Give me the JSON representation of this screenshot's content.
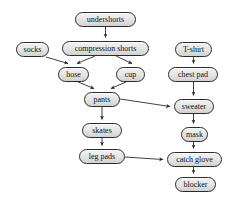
{
  "diagram": {
    "background_color": "#ffffff",
    "node_fill_color": "#e3e3e3",
    "node_border_color": "#2b2b2b",
    "edge_color": "#2b2b2b",
    "text_color": "#111111",
    "nodes": [
      {
        "id": "undershorts",
        "label": "undershorts",
        "x": 75,
        "y": 12,
        "w": 61,
        "h": 15
      },
      {
        "id": "socks",
        "label": "socks",
        "x": 16,
        "y": 42,
        "w": 33,
        "h": 15
      },
      {
        "id": "compression-shorts",
        "label": "compression shorts",
        "x": 62,
        "y": 41,
        "w": 87,
        "h": 15
      },
      {
        "id": "t-shirt",
        "label": "T-shirt",
        "x": 175,
        "y": 42,
        "w": 37,
        "h": 15
      },
      {
        "id": "hose",
        "label": "hose",
        "x": 58,
        "y": 67,
        "w": 31,
        "h": 15
      },
      {
        "id": "cup",
        "label": "cup",
        "x": 116,
        "y": 67,
        "w": 29,
        "h": 15
      },
      {
        "id": "chest-pad",
        "label": "chest pad",
        "x": 168,
        "y": 67,
        "w": 50,
        "h": 15
      },
      {
        "id": "pants",
        "label": "pants",
        "x": 84,
        "y": 92,
        "w": 36,
        "h": 15
      },
      {
        "id": "sweater",
        "label": "sweater",
        "x": 174,
        "y": 99,
        "w": 40,
        "h": 15
      },
      {
        "id": "skates",
        "label": "skates",
        "x": 82,
        "y": 123,
        "w": 40,
        "h": 15
      },
      {
        "id": "mask",
        "label": "mask",
        "x": 181,
        "y": 127,
        "w": 27,
        "h": 15
      },
      {
        "id": "leg-pads",
        "label": "leg pads",
        "x": 79,
        "y": 149,
        "w": 46,
        "h": 15
      },
      {
        "id": "catch-glove",
        "label": "catch glove",
        "x": 167,
        "y": 152,
        "w": 55,
        "h": 15
      },
      {
        "id": "blocker",
        "label": "blocker",
        "x": 175,
        "y": 177,
        "w": 41,
        "h": 15
      }
    ],
    "edges": [
      {
        "from": "undershorts",
        "to": "compression-shorts",
        "path": "M 105.5 27 L 105.5 37.5"
      },
      {
        "from": "socks",
        "to": "hose",
        "path": "M 46 57 L 68 63.5"
      },
      {
        "from": "compression-shorts",
        "to": "hose",
        "path": "M 95 56 L 77 63.5"
      },
      {
        "from": "compression-shorts",
        "to": "cup",
        "path": "M 116 56 L 132 63.5"
      },
      {
        "from": "hose",
        "to": "pants",
        "path": "M 78 82 L 94 88.5"
      },
      {
        "from": "cup",
        "to": "pants",
        "path": "M 126 82 L 111 88.5"
      },
      {
        "from": "pants",
        "to": "skates",
        "path": "M 102 107 L 102 119.5"
      },
      {
        "from": "pants",
        "to": "sweater",
        "path": "M 120 99 L 170 106.5"
      },
      {
        "from": "skates",
        "to": "leg-pads",
        "path": "M 102 138 L 102 145.5"
      },
      {
        "from": "leg-pads",
        "to": "catch-glove",
        "path": "M 125 157 L 163 159.5"
      },
      {
        "from": "t-shirt",
        "to": "chest-pad",
        "path": "M 193.5 57 L 193.5 63.5"
      },
      {
        "from": "chest-pad",
        "to": "sweater",
        "path": "M 193.5 82 L 193.5 95.5"
      },
      {
        "from": "sweater",
        "to": "mask",
        "path": "M 193.5 114 L 193.5 123.5"
      },
      {
        "from": "mask",
        "to": "catch-glove",
        "path": "M 193.5 142 L 193.5 148.5"
      },
      {
        "from": "catch-glove",
        "to": "blocker",
        "path": "M 193.5 167 L 193.5 173.5"
      }
    ]
  }
}
